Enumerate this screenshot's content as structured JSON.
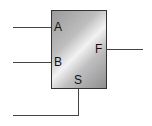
{
  "diagram": {
    "type": "multiplexer-block",
    "colors": {
      "wire": "#444444",
      "border": "#333333",
      "fill": "#bdbdbd",
      "highlight": "#f2f2f2"
    },
    "inputs": [
      {
        "label": "A"
      },
      {
        "label": "B"
      }
    ],
    "select": {
      "label": "S"
    },
    "output": {
      "label": "F"
    }
  }
}
